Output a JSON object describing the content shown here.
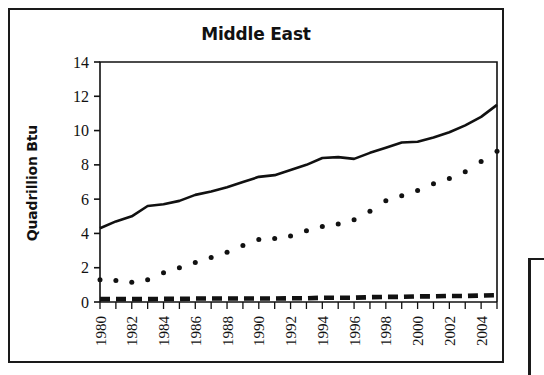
{
  "chart_data": {
    "type": "line",
    "title": "Middle East",
    "xlabel": "",
    "ylabel": "Quadrillion Btu",
    "xlim": [
      1980,
      2005
    ],
    "ylim": [
      0,
      14
    ],
    "yticks": [
      0,
      2,
      4,
      6,
      8,
      10,
      12,
      14
    ],
    "ytick_labels": [
      "0",
      "2",
      "4",
      "6",
      "8",
      "10",
      "12",
      "14"
    ],
    "xticks": [
      1980,
      1982,
      1984,
      1986,
      1988,
      1990,
      1992,
      1994,
      1996,
      1998,
      2000,
      2002,
      2004
    ],
    "xtick_labels": [
      "1980",
      "1982",
      "1984",
      "1986",
      "1988",
      "1990",
      "1992",
      "1994",
      "1996",
      "1998",
      "2000",
      "2002",
      "2004"
    ],
    "x": [
      1980,
      1981,
      1982,
      1983,
      1984,
      1985,
      1986,
      1987,
      1988,
      1989,
      1990,
      1991,
      1992,
      1993,
      1994,
      1995,
      1996,
      1997,
      1998,
      1999,
      2000,
      2001,
      2002,
      2003,
      2004,
      2005
    ],
    "grid": false,
    "legend": "none",
    "series": [
      {
        "name": "series-solid",
        "style": "solid",
        "color": "#111111",
        "values": [
          4.3,
          4.7,
          5.0,
          5.6,
          5.7,
          5.9,
          6.25,
          6.45,
          6.7,
          7.0,
          7.3,
          7.4,
          7.7,
          8.0,
          8.4,
          8.45,
          8.35,
          8.7,
          9.0,
          9.3,
          9.35,
          9.6,
          9.9,
          10.3,
          10.8,
          11.5
        ]
      },
      {
        "name": "series-dotted",
        "style": "dotted",
        "color": "#111111",
        "values": [
          1.3,
          1.25,
          1.15,
          1.3,
          1.7,
          2.0,
          2.3,
          2.6,
          2.9,
          3.3,
          3.65,
          3.7,
          3.85,
          4.15,
          4.4,
          4.55,
          4.8,
          5.3,
          5.9,
          6.2,
          6.5,
          6.9,
          7.2,
          7.6,
          8.2,
          8.8
        ]
      },
      {
        "name": "series-dashed",
        "style": "dashed",
        "color": "#111111",
        "values": [
          0.17,
          0.17,
          0.17,
          0.17,
          0.18,
          0.18,
          0.2,
          0.2,
          0.2,
          0.2,
          0.2,
          0.2,
          0.22,
          0.22,
          0.25,
          0.25,
          0.25,
          0.28,
          0.3,
          0.3,
          0.33,
          0.33,
          0.35,
          0.35,
          0.38,
          0.4
        ]
      }
    ]
  },
  "figure": {
    "background_color": "#ffffff",
    "frame_color": "#1a1a1a",
    "axis_color": "#111111"
  }
}
